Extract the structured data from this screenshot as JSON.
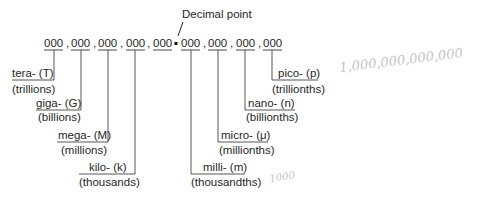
{
  "diagram": {
    "title_label": "Decimal point",
    "groups": [
      "000",
      "000",
      "000",
      "000",
      "000",
      "000",
      "000",
      "000",
      "000"
    ],
    "separator": ",",
    "decimal_point": ".",
    "prefixes": [
      {
        "name": "tera- (T)",
        "meaning": "(trillions)"
      },
      {
        "name": "giga- (G)",
        "meaning": "(billions)"
      },
      {
        "name": "mega- (M)",
        "meaning": "(millions)"
      },
      {
        "name": "kilo- (k)",
        "meaning": "(thousands)"
      },
      {
        "name": "milli- (m)",
        "meaning": "(thousandths)"
      },
      {
        "name": "micro- (μ)",
        "meaning": "(millionths)"
      },
      {
        "name": "nano- (n)",
        "meaning": "(billionths)"
      },
      {
        "name": "pico- (p)",
        "meaning": "(trillionths)"
      }
    ],
    "handwritten_notes": [
      "1,000,000,000,000",
      "1000"
    ]
  }
}
